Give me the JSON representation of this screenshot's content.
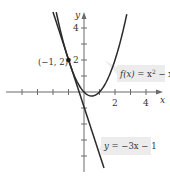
{
  "chart_data": {
    "type": "line",
    "title": "",
    "xlabel": "x",
    "ylabel": "y",
    "xlim": [
      -5,
      5
    ],
    "ylim": [
      -5,
      5.5
    ],
    "grid": false,
    "x_ticks": [
      -4,
      -3,
      -2,
      -1,
      1,
      2,
      3,
      4
    ],
    "x_tick_labels": [
      {
        "value": 2,
        "label": "2"
      },
      {
        "value": 4,
        "label": "4"
      }
    ],
    "y_ticks": [
      -4,
      -3,
      -2,
      -1,
      1,
      2,
      3,
      4
    ],
    "y_tick_labels": [
      {
        "value": 2,
        "label": "2"
      },
      {
        "value": 4,
        "label": "4"
      }
    ],
    "series": [
      {
        "name": "f(x) = x^2 - x",
        "kind": "parabola",
        "expression": "x^2 - x",
        "x": [
          -1.8,
          -1.5,
          -1,
          -0.5,
          0,
          0.5,
          1,
          1.5,
          2,
          2.5,
          2.8
        ],
        "values": [
          5.04,
          3.75,
          2,
          0.75,
          0,
          -0.25,
          0,
          0.75,
          2,
          3.75,
          5.04
        ]
      },
      {
        "name": "y = -3x - 1",
        "kind": "tangent-line",
        "expression": "-3x - 1",
        "x": [
          -2,
          1.25
        ],
        "values": [
          5,
          -4.75
        ]
      }
    ],
    "annotations": [
      {
        "type": "point",
        "x": -1,
        "y": 2,
        "label": "(−1, 2)"
      },
      {
        "type": "callout",
        "label": "f(x) = x² − x",
        "target_series": 0
      },
      {
        "type": "callout",
        "label": "y = −3x − 1",
        "target_series": 1
      }
    ]
  },
  "labels": {
    "x_axis": "x",
    "y_axis": "y",
    "x_tick_2": "2",
    "x_tick_4": "4",
    "y_tick_2": "2",
    "y_tick_4": "4",
    "point": "(−1, 2)",
    "parabola_fn": "f(x)",
    "parabola_eq": " = x",
    "parabola_exp": "2",
    "parabola_tail": " − x",
    "line_y": "y",
    "line_eq": " = −3x − 1"
  }
}
